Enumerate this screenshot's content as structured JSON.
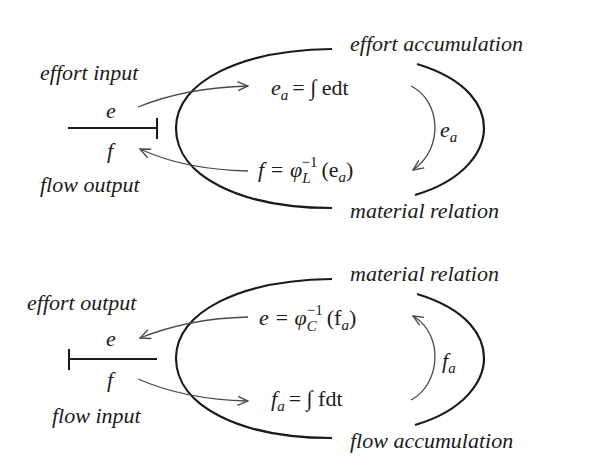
{
  "diagrams": [
    {
      "id": "inductive",
      "labels": {
        "port_top": "effort input",
        "port_bottom": "flow output",
        "top_right": "effort accumulation",
        "bottom_right": "material relation"
      },
      "bond": {
        "effort": "e",
        "flow": "f",
        "causal_stroke": "right"
      },
      "equations": {
        "top": {
          "lhs": "e",
          "lhs_sub": "a",
          "rhs": "= ∫ edt"
        },
        "bottom": {
          "lhs": "f = φ",
          "sub": "L",
          "sup": "−1",
          "arg": "(e",
          "arg_sub": "a",
          "close": ")"
        }
      },
      "loop_label": {
        "main": "e",
        "sub": "a"
      }
    },
    {
      "id": "capacitive",
      "labels": {
        "port_top": "effort output",
        "port_bottom": "flow input",
        "top_right": "material relation",
        "bottom_right": "flow accumulation"
      },
      "bond": {
        "effort": "e",
        "flow": "f",
        "causal_stroke": "left"
      },
      "equations": {
        "top": {
          "lhs": "e = φ",
          "sub": "C",
          "sup": "−1",
          "arg": "(f",
          "arg_sub": "a",
          "close": ")"
        },
        "bottom": {
          "lhs": "f",
          "lhs_sub": "a",
          "rhs": "= ∫ fdt"
        }
      },
      "loop_label": {
        "main": "f",
        "sub": "a"
      }
    }
  ],
  "colors": {
    "ink": "#1a1a1a",
    "arrow": "#4a4a4a",
    "background": "#ffffff"
  }
}
